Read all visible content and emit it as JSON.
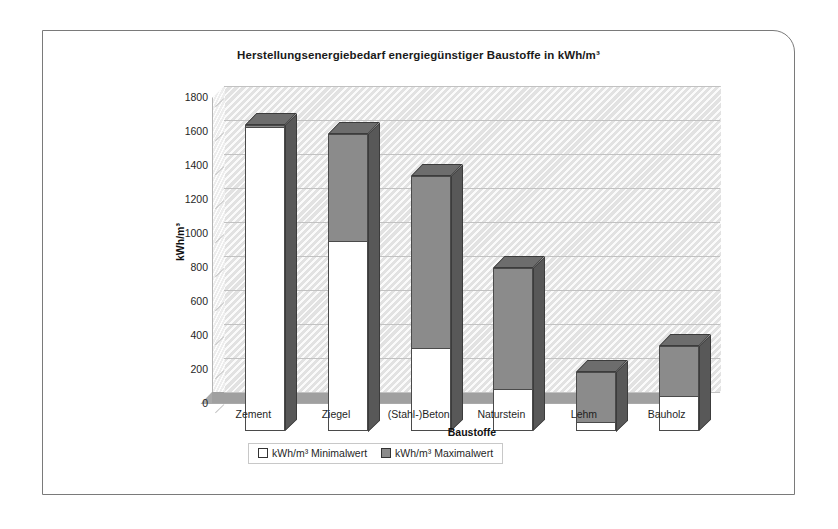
{
  "chart_data": {
    "type": "bar",
    "title": "Herstellungsenergiebedarf energiegünstiger Baustoffe in kWh/m³",
    "xlabel": "Baustoffe",
    "ylabel": "kWh/m³",
    "ylim": [
      0,
      1800
    ],
    "yticks": [
      0,
      200,
      400,
      600,
      800,
      1000,
      1200,
      1400,
      1600,
      1800
    ],
    "grid": true,
    "legend_position": "bottom",
    "style": "3d-column-overlap",
    "categories": [
      "Zement",
      "Ziegel",
      "(Stahl-)Beton",
      "Naturstein",
      "Lehm",
      "Bauholz"
    ],
    "series": [
      {
        "name": "kWh/m³ Minimalwert",
        "color": "#ffffff",
        "values": [
          1780,
          1110,
          480,
          240,
          50,
          200
        ]
      },
      {
        "name": "kWh/m³ Maximalwert",
        "color": "#8b8b8b",
        "values": [
          1800,
          1750,
          1500,
          960,
          350,
          500
        ]
      }
    ]
  },
  "legend": {
    "items": [
      {
        "label": "kWh/m³ Minimalwert",
        "swatch": "white-square-icon"
      },
      {
        "label": "kWh/m³ Maximalwert",
        "swatch": "gray-square-icon"
      }
    ]
  },
  "colors": {
    "bar_max": "#8b8b8b",
    "bar_min": "#ffffff",
    "bar_side": "#585858",
    "bar_top": "#6d6d6d",
    "plot_background": "#e2e2e2",
    "floor": "#a9a9a9",
    "gridline": "#c2c2c2",
    "frame_border": "#7a7a7a",
    "text": "#1f1f1f"
  }
}
